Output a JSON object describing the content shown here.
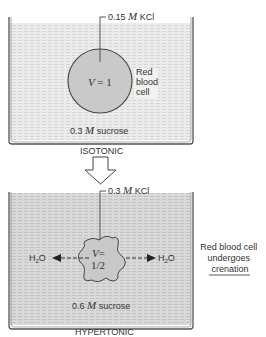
{
  "top_panel": {
    "kcl_prefix": "0.15",
    "kcl_unit": "M",
    "kcl_suffix": "KCl",
    "cell_volume_var": "V",
    "cell_volume_value": "= 1",
    "cell_label_lines": [
      "Red",
      "blood",
      "cell"
    ],
    "solution_prefix": "0.3",
    "solution_unit": "M",
    "solution_suffix": "sucrose",
    "condition": "ISOTONIC"
  },
  "bottom_panel": {
    "kcl_prefix": "0.3",
    "kcl_unit": "M",
    "kcl_suffix": "KCl",
    "cell_volume_var": "V",
    "cell_volume_eq": "=",
    "cell_volume_value": "1/2",
    "water_left": "H",
    "water_sub": "2",
    "water_o": "O",
    "solution_prefix": "0.6",
    "solution_unit": "M",
    "solution_suffix": "sucrose",
    "condition": "HYPERTONIC",
    "side_note_lines": [
      "Red blood cell",
      "undergoes",
      "crenation"
    ]
  },
  "colors": {
    "solution_light": "#eaeaea",
    "solution_dark": "#d4d4d4",
    "cell": "#c8c8c8",
    "outline": "#444444"
  }
}
